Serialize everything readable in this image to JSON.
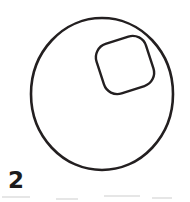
{
  "figure": {
    "label": "2",
    "caption_number": "2",
    "background_color": "#ffffff",
    "stroke_color": "#231f20",
    "label_color": "#1c1c1c",
    "width": 190,
    "height": 202,
    "shapes": {
      "outer_circle": {
        "name": "outer-circle",
        "type": "circle",
        "center_x": 102,
        "center_y": 94,
        "radius_x": 71,
        "radius_y": 76,
        "stroke_width": 2.6,
        "fill": "none"
      },
      "inner_rounded_square": {
        "name": "inner-rounded-square",
        "type": "rounded-square",
        "center_x": 125,
        "center_y": 65,
        "size": 52,
        "corner_radius": 14,
        "rotation_deg": -18,
        "stroke_width": 2.4,
        "fill": "none"
      }
    },
    "scan_artifacts": [
      {
        "left": 2,
        "top": 3,
        "width": 28
      },
      {
        "left": 56,
        "top": 5,
        "width": 22
      },
      {
        "left": 104,
        "top": 2,
        "width": 36
      },
      {
        "left": 152,
        "top": 4,
        "width": 20
      }
    ]
  }
}
